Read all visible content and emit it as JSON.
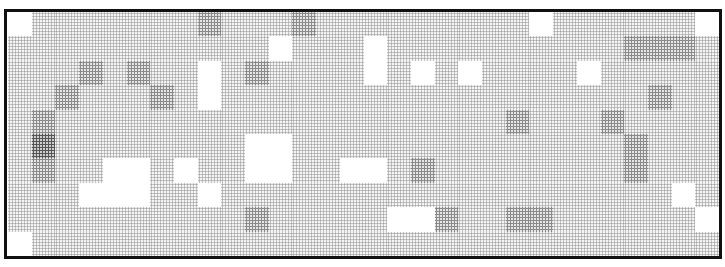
{
  "mosaic": {
    "columns": 30,
    "rows": 10,
    "border_color": "#111111",
    "shade_palette": {
      "0": "#ffffff",
      "1": "#e8e8e8",
      "2": "#d6d6d6",
      "3": "#c2c2c2",
      "4": "#8e8e8e"
    },
    "cells": [
      [
        0,
        2,
        2,
        2,
        2,
        2,
        2,
        2,
        3,
        2,
        2,
        2,
        3,
        2,
        2,
        2,
        2,
        2,
        2,
        2,
        2,
        2,
        0,
        2,
        2,
        2,
        2,
        2,
        2,
        0
      ],
      [
        2,
        2,
        2,
        2,
        2,
        2,
        2,
        2,
        2,
        2,
        2,
        0,
        2,
        2,
        2,
        0,
        2,
        2,
        2,
        2,
        2,
        2,
        2,
        2,
        2,
        2,
        3,
        3,
        3,
        2
      ],
      [
        2,
        2,
        2,
        3,
        2,
        3,
        2,
        2,
        0,
        2,
        3,
        2,
        2,
        2,
        2,
        0,
        2,
        0,
        2,
        0,
        2,
        2,
        2,
        2,
        0,
        2,
        2,
        2,
        2,
        2
      ],
      [
        2,
        2,
        3,
        2,
        2,
        2,
        3,
        2,
        0,
        2,
        2,
        2,
        2,
        2,
        2,
        2,
        2,
        2,
        2,
        2,
        2,
        2,
        2,
        2,
        2,
        2,
        2,
        3,
        2,
        2
      ],
      [
        2,
        3,
        2,
        2,
        2,
        2,
        2,
        2,
        2,
        2,
        2,
        2,
        2,
        2,
        2,
        2,
        2,
        2,
        2,
        2,
        2,
        3,
        2,
        2,
        2,
        3,
        2,
        2,
        2,
        2
      ],
      [
        2,
        4,
        2,
        2,
        2,
        2,
        2,
        2,
        2,
        2,
        0,
        0,
        2,
        2,
        2,
        2,
        2,
        2,
        2,
        2,
        2,
        2,
        2,
        2,
        2,
        2,
        3,
        2,
        2,
        2
      ],
      [
        2,
        3,
        2,
        2,
        0,
        0,
        2,
        0,
        2,
        2,
        0,
        0,
        2,
        2,
        0,
        0,
        2,
        3,
        2,
        2,
        2,
        2,
        2,
        2,
        2,
        2,
        3,
        2,
        2,
        2
      ],
      [
        2,
        2,
        2,
        0,
        0,
        0,
        2,
        2,
        0,
        2,
        2,
        2,
        2,
        2,
        2,
        2,
        2,
        2,
        2,
        2,
        2,
        2,
        2,
        2,
        2,
        2,
        2,
        2,
        0,
        2
      ],
      [
        2,
        2,
        2,
        2,
        2,
        2,
        2,
        2,
        2,
        2,
        3,
        2,
        2,
        2,
        2,
        2,
        0,
        0,
        3,
        2,
        2,
        3,
        3,
        2,
        2,
        2,
        2,
        2,
        2,
        0
      ],
      [
        0,
        2,
        2,
        2,
        2,
        2,
        2,
        2,
        2,
        2,
        2,
        2,
        2,
        2,
        2,
        2,
        2,
        2,
        2,
        2,
        2,
        2,
        2,
        2,
        2,
        2,
        2,
        2,
        2,
        2
      ]
    ]
  }
}
